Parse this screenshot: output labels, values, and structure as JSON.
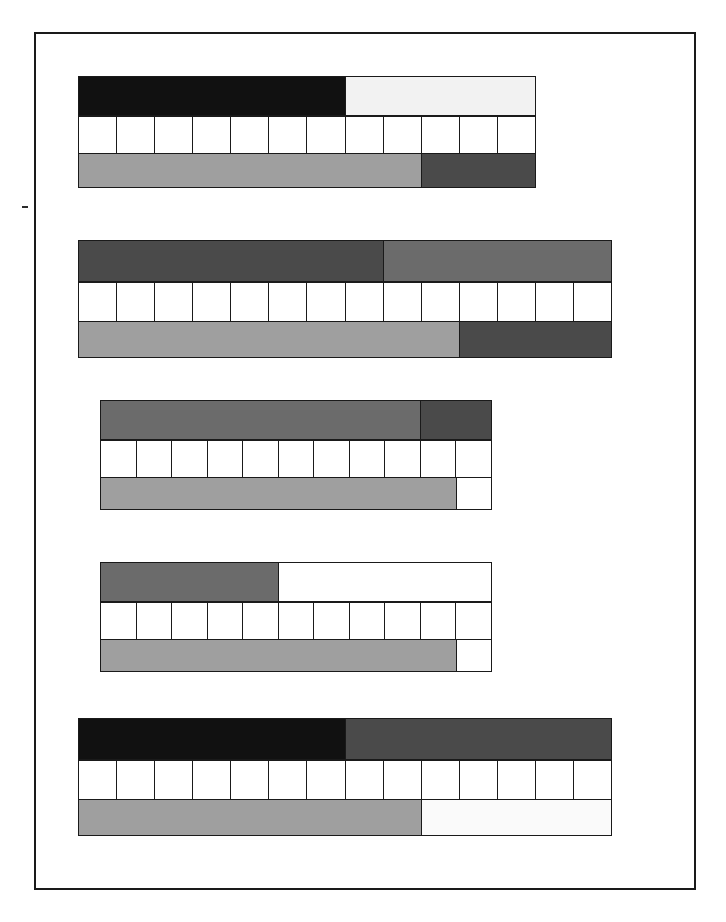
{
  "page": {
    "background_color": "#ffffff",
    "frame": {
      "border_color": "#1a1a1a",
      "x": 34,
      "y": 32,
      "width": 662,
      "height": 858
    }
  },
  "palette": {
    "black": "#111111",
    "dark_gray": "#3d3d3d",
    "medium_gray": "#6b6b6b",
    "light_gray": "#9f9f9f",
    "very_light_gray": "#f2f2f2",
    "white": "#ffffff",
    "outline": "#1a1a1a"
  },
  "chart_data": {
    "type": "bar",
    "subtitle": "",
    "xlabel": "",
    "ylabel": "",
    "grid": false,
    "legend_position": "none",
    "orientation": "horizontal-stacked",
    "groups": [
      {
        "id": "group-1",
        "index": 1,
        "x": 78,
        "y": 76,
        "width": 458,
        "top_bar": {
          "height": 40,
          "segments": [
            {
              "name": "segment-a",
              "color": "#111111",
              "fraction": 0.583,
              "percent": 58.3
            },
            {
              "name": "segment-b",
              "color": "#f2f2f2",
              "fraction": 0.417,
              "percent": 41.7
            }
          ]
        },
        "cells_row": {
          "height": 38,
          "count": 12,
          "fill": "#ffffff"
        },
        "bottom_bar": {
          "height": 34,
          "segments": [
            {
              "name": "segment-a",
              "color": "#9f9f9f",
              "fraction": 0.75,
              "percent": 75.0
            },
            {
              "name": "segment-b",
              "color": "#4a4a4a",
              "fraction": 0.25,
              "percent": 25.0
            }
          ]
        }
      },
      {
        "id": "group-2",
        "index": 2,
        "x": 78,
        "y": 240,
        "width": 534,
        "top_bar": {
          "height": 42,
          "segments": [
            {
              "name": "segment-a",
              "color": "#4a4a4a",
              "fraction": 0.571,
              "percent": 57.1
            },
            {
              "name": "segment-b",
              "color": "#6b6b6b",
              "fraction": 0.429,
              "percent": 42.9
            }
          ]
        },
        "cells_row": {
          "height": 40,
          "count": 14,
          "fill": "#ffffff"
        },
        "bottom_bar": {
          "height": 36,
          "segments": [
            {
              "name": "segment-a",
              "color": "#9f9f9f",
              "fraction": 0.714,
              "percent": 71.4
            },
            {
              "name": "segment-b",
              "color": "#4a4a4a",
              "fraction": 0.286,
              "percent": 28.6
            }
          ]
        }
      },
      {
        "id": "group-3",
        "index": 3,
        "x": 100,
        "y": 400,
        "width": 392,
        "top_bar": {
          "height": 40,
          "segments": [
            {
              "name": "segment-a",
              "color": "#6b6b6b",
              "fraction": 0.818,
              "percent": 81.8
            },
            {
              "name": "segment-b",
              "color": "#4a4a4a",
              "fraction": 0.182,
              "percent": 18.2
            }
          ]
        },
        "cells_row": {
          "height": 38,
          "count": 11,
          "fill": "#ffffff"
        },
        "bottom_bar": {
          "height": 32,
          "segments": [
            {
              "name": "segment-a",
              "color": "#9f9f9f",
              "fraction": 0.909,
              "percent": 90.9
            },
            {
              "name": "segment-b",
              "color": "#ffffff",
              "fraction": 0.091,
              "percent": 9.1
            }
          ]
        }
      },
      {
        "id": "group-4",
        "index": 4,
        "x": 100,
        "y": 562,
        "width": 392,
        "top_bar": {
          "height": 40,
          "segments": [
            {
              "name": "segment-a",
              "color": "#6b6b6b",
              "fraction": 0.455,
              "percent": 45.5
            },
            {
              "name": "segment-b",
              "color": "#ffffff",
              "fraction": 0.545,
              "percent": 54.5
            }
          ]
        },
        "cells_row": {
          "height": 38,
          "count": 11,
          "fill": "#ffffff"
        },
        "bottom_bar": {
          "height": 32,
          "segments": [
            {
              "name": "segment-a",
              "color": "#9f9f9f",
              "fraction": 0.909,
              "percent": 90.9
            },
            {
              "name": "segment-b",
              "color": "#ffffff",
              "fraction": 0.091,
              "percent": 9.1
            }
          ]
        }
      },
      {
        "id": "group-5",
        "index": 5,
        "x": 78,
        "y": 718,
        "width": 534,
        "top_bar": {
          "height": 42,
          "segments": [
            {
              "name": "segment-a",
              "color": "#111111",
              "fraction": 0.5,
              "percent": 50.0
            },
            {
              "name": "segment-b",
              "color": "#4a4a4a",
              "fraction": 0.5,
              "percent": 50.0
            }
          ]
        },
        "cells_row": {
          "height": 40,
          "count": 14,
          "fill": "#ffffff"
        },
        "bottom_bar": {
          "height": 36,
          "segments": [
            {
              "name": "segment-a",
              "color": "#9f9f9f",
              "fraction": 0.643,
              "percent": 64.3
            },
            {
              "name": "segment-b",
              "color": "#fafafa",
              "fraction": 0.357,
              "percent": 35.7
            }
          ]
        }
      }
    ]
  }
}
